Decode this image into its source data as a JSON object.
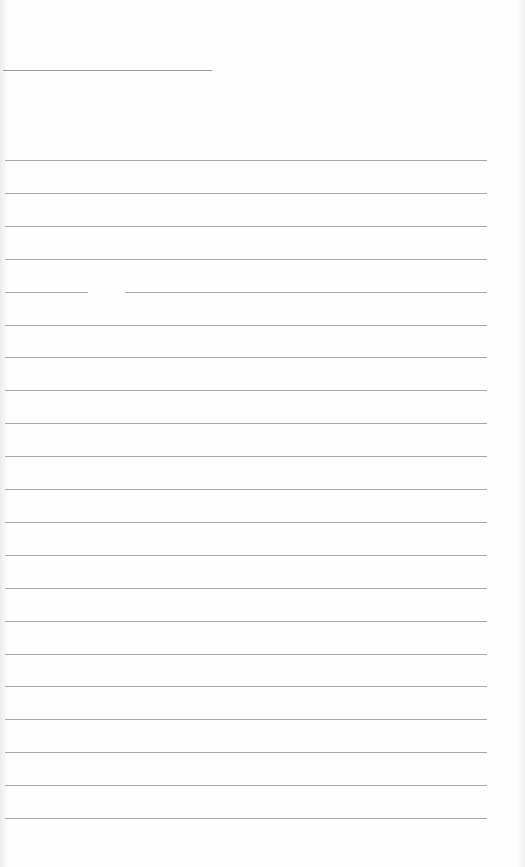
{
  "page": {
    "type": "blank ruled sheet",
    "header_line": {
      "visible": true
    },
    "ruled_lines": {
      "count": 21,
      "first_y": 160,
      "spacing": 32.9
    },
    "text": ""
  },
  "colors": {
    "paper": "#fefefe",
    "rule": "#a8a8a8",
    "header_line": "#9a9a9a"
  }
}
